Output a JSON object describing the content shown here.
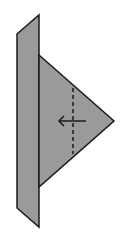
{
  "diagram": {
    "colors": {
      "background": "#ffffff",
      "fill": "#9a9a9a",
      "stroke": "#1a1a1a"
    },
    "strip": {
      "points": "17,34 39,15 39,227 17,208"
    },
    "triangle": {
      "points": "39,55 114,121 39,187"
    },
    "fold_line": {
      "x1": 73,
      "y1": 88,
      "x2": 73,
      "y2": 154,
      "style": "dashed"
    },
    "arrow": {
      "from": [
        86,
        121
      ],
      "to": [
        59,
        121
      ],
      "direction": "left"
    }
  }
}
